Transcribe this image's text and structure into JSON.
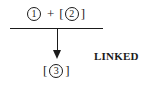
{
  "diagram": {
    "top_expression": {
      "operand_1": "1",
      "operator": "+",
      "bracket_open": "[",
      "operand_2": "2",
      "bracket_close": "]"
    },
    "result_expression": {
      "bracket_open": "[",
      "operand_3": "3",
      "bracket_close": "]"
    },
    "arrow_label": "LINKED",
    "colors": {
      "ink": "#1a1a1a",
      "background": "#ffffff"
    }
  }
}
